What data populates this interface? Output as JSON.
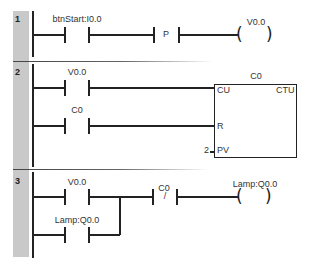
{
  "diagram": {
    "type": "ladder-logic",
    "rungs": [
      {
        "number": "1",
        "elements": [
          {
            "kind": "no-contact",
            "label": "btnStart:I0.0"
          },
          {
            "kind": "positive-transition",
            "symbol": "P"
          },
          {
            "kind": "coil",
            "label": "V0.0"
          }
        ]
      },
      {
        "number": "2",
        "elements": [
          {
            "kind": "no-contact",
            "label": "V0.0"
          },
          {
            "kind": "no-contact",
            "label": "C0"
          },
          {
            "kind": "counter-block",
            "name": "C0",
            "type": "CTU",
            "pins": {
              "cu": "CU",
              "r": "R",
              "pv": "PV"
            },
            "pv_value": "2"
          }
        ]
      },
      {
        "number": "3",
        "elements": [
          {
            "kind": "no-contact",
            "label": "V0.0"
          },
          {
            "kind": "no-contact",
            "label": "Lamp:Q0.0"
          },
          {
            "kind": "nc-contact",
            "label": "C0",
            "symbol": "/"
          },
          {
            "kind": "coil",
            "label": "Lamp:Q0.0"
          }
        ]
      }
    ]
  },
  "colors": {
    "gutter": "#c9c9c9",
    "line": "#222222"
  }
}
